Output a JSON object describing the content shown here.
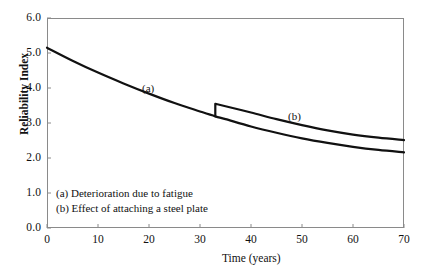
{
  "chart_data": {
    "type": "line",
    "title": "",
    "xlabel": "Time (years)",
    "ylabel": "Reliability Index",
    "xlim": [
      0,
      70
    ],
    "ylim": [
      0.0,
      6.0
    ],
    "xticks": [
      "0",
      "10",
      "20",
      "30",
      "40",
      "50",
      "60",
      "70"
    ],
    "xtick_values": [
      0,
      10,
      20,
      30,
      40,
      50,
      60,
      70
    ],
    "yticks": [
      "0.0",
      "1.0",
      "2.0",
      "3.0",
      "4.0",
      "5.0",
      "6.0"
    ],
    "ytick_values": [
      0.0,
      1.0,
      2.0,
      3.0,
      4.0,
      5.0,
      6.0
    ],
    "grid": false,
    "legend_position": "inside-lower-left",
    "line_color": "#111111",
    "axis_color": "#8a8a8a",
    "intervention_year": 33,
    "series": [
      {
        "name": "(a)",
        "label": "(a) Deterioration due to fatigue",
        "x": [
          0,
          5,
          10,
          15,
          20,
          25,
          30,
          33,
          35,
          40,
          45,
          50,
          55,
          60,
          65,
          70
        ],
        "values": [
          5.15,
          4.78,
          4.44,
          4.13,
          3.84,
          3.57,
          3.33,
          3.19,
          3.11,
          2.9,
          2.72,
          2.56,
          2.43,
          2.32,
          2.23,
          2.16
        ]
      },
      {
        "name": "(b)",
        "label": "(b) Effect of attaching a steel plate",
        "x": [
          33,
          33,
          35,
          40,
          45,
          50,
          55,
          60,
          65,
          70
        ],
        "values": [
          3.19,
          3.55,
          3.48,
          3.3,
          3.11,
          2.94,
          2.79,
          2.67,
          2.58,
          2.51
        ]
      }
    ],
    "annotations": [
      {
        "text": "(a)",
        "x": 19,
        "y": 3.95
      },
      {
        "text": "(b)",
        "x": 48,
        "y": 3.15
      }
    ]
  },
  "annotations": {
    "tag_a": "(a)",
    "tag_b": "(b)"
  },
  "legend": {
    "line_a": "(a) Deterioration due to fatigue",
    "line_b": "(b) Effect of attaching a steel plate"
  },
  "axes": {
    "y_title": "Reliability Index",
    "x_title": "Time (years)",
    "y_ticks": [
      "6.0",
      "5.0",
      "4.0",
      "3.0",
      "2.0",
      "1.0",
      "0.0"
    ],
    "x_ticks": [
      "0",
      "10",
      "20",
      "30",
      "40",
      "50",
      "60",
      "70"
    ]
  }
}
